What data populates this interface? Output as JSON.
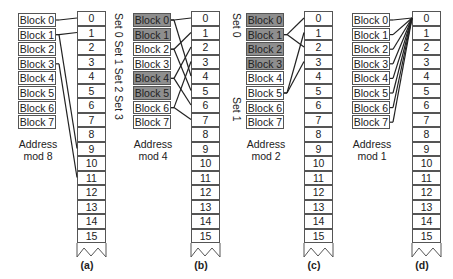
{
  "figure": {
    "panels": [
      {
        "id": "a",
        "caption": "(a)",
        "address_label_line1": "Address",
        "address_label_line2": "mod 8",
        "blocks": [
          "Block 0",
          "Block 1",
          "Block 2",
          "Block 3",
          "Block 4",
          "Block 5",
          "Block 6",
          "Block 7"
        ],
        "shaded_blocks": [],
        "set_labels": [],
        "mappings": [
          [
            0,
            0
          ],
          [
            1,
            1
          ],
          [
            1,
            9
          ],
          [
            3,
            11
          ]
        ]
      },
      {
        "id": "b",
        "caption": "(b)",
        "address_label_line1": "Address",
        "address_label_line2": "mod 4",
        "blocks": [
          "Block 0",
          "Block 1",
          "Block 2",
          "Block 3",
          "Block 4",
          "Block 5",
          "Block 6",
          "Block 7"
        ],
        "shaded_blocks": [
          0,
          1,
          4,
          5
        ],
        "set_labels": [
          "Set 0",
          "Set 1",
          "Set 2",
          "Set 3"
        ],
        "mappings": [
          [
            0,
            0
          ],
          [
            0,
            4
          ],
          [
            2,
            1
          ],
          [
            2,
            5
          ],
          [
            4,
            2
          ],
          [
            4,
            6
          ],
          [
            6,
            3
          ],
          [
            6,
            7
          ]
        ]
      },
      {
        "id": "c",
        "caption": "(c)",
        "address_label_line1": "Address",
        "address_label_line2": "mod 2",
        "blocks": [
          "Block 0",
          "Block 1",
          "Block 2",
          "Block 3",
          "Block 4",
          "Block 5",
          "Block 6",
          "Block 7"
        ],
        "shaded_blocks": [
          0,
          1,
          2,
          3
        ],
        "set_labels": [
          "Set 0",
          "Set 1"
        ],
        "mappings": [
          [
            1,
            0
          ],
          [
            1,
            2
          ],
          [
            5,
            1
          ],
          [
            5,
            3
          ]
        ]
      },
      {
        "id": "d",
        "caption": "(d)",
        "address_label_line1": "Address",
        "address_label_line2": "mod 1",
        "blocks": [
          "Block 0",
          "Block 1",
          "Block 2",
          "Block 3",
          "Block 4",
          "Block 5",
          "Block 6",
          "Block 7"
        ],
        "shaded_blocks": [],
        "set_labels": [],
        "mappings": [
          [
            0,
            0
          ],
          [
            1,
            0
          ],
          [
            2,
            0
          ],
          [
            3,
            0
          ],
          [
            4,
            0
          ],
          [
            5,
            0
          ],
          [
            6,
            0
          ],
          [
            7,
            0
          ]
        ]
      }
    ],
    "memory_addresses": [
      "0",
      "1",
      "2",
      "3",
      "4",
      "5",
      "6",
      "7",
      "8",
      "9",
      "10",
      "11",
      "12",
      "13",
      "14",
      "15"
    ]
  }
}
